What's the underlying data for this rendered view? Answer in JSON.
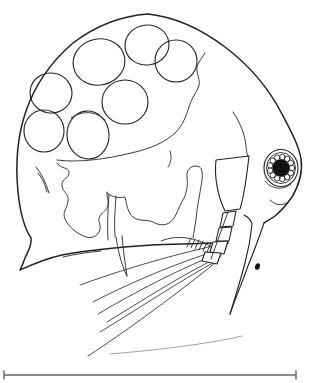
{
  "figure": {
    "background_color": "#ffffff",
    "ink_color": "#222222",
    "egg_count": 7,
    "eggs": [
      {
        "cx": 99,
        "cy": 62,
        "rx": 26,
        "ry": 23,
        "rot": -12
      },
      {
        "cx": 147,
        "cy": 45,
        "rx": 22,
        "ry": 20,
        "rot": -8
      },
      {
        "cx": 176,
        "cy": 61,
        "rx": 21,
        "ry": 21,
        "rot": 0
      },
      {
        "cx": 51,
        "cy": 93,
        "rx": 21,
        "ry": 20,
        "rot": 10
      },
      {
        "cx": 125,
        "cy": 102,
        "rx": 23,
        "ry": 22,
        "rot": 0
      },
      {
        "cx": 44,
        "cy": 131,
        "rx": 20,
        "ry": 21,
        "rot": 0
      },
      {
        "cx": 88,
        "cy": 135,
        "rx": 21,
        "ry": 24,
        "rot": -5
      }
    ],
    "eye": {
      "center": [
        281,
        168
      ],
      "pupil_radius": 8.5,
      "pupil_color": "#111111",
      "ommatidia_count": 13,
      "ommatidia_radius": 2.8,
      "ommatidia_ring_radius": 11,
      "inner_ring": {
        "rx": 14.5,
        "ry": 15.5
      },
      "outer_ring": {
        "rx": 17,
        "ry": 18.5
      }
    },
    "swimming_setae": [
      {
        "d": "M 229 243 C 195 249 135 265 80 285"
      },
      {
        "d": "M 226 248 C 190 258 135 280 93 302"
      },
      {
        "d": "M 223 252 C 185 266 135 292 98 314"
      },
      {
        "d": "M 221 256 C 183 274 140 302 107 322"
      },
      {
        "d": "M 218 260 C 180 281 133 312 100 332"
      },
      {
        "d": "M 215 263 C 182 290 128 330 88 356"
      }
    ],
    "faint_seta": {
      "d": "M 242 336 C 208 344 158 350 110 354"
    },
    "antenna_segments": [
      {
        "points": "223,213 236,211 233,226 220,227"
      },
      {
        "points": "219,228 232,227 229,241 216,241"
      },
      {
        "points": "213,242 228,241 224,254 210,252"
      },
      {
        "points": "205,252 221,253 217,264 202,261"
      }
    ],
    "comb_ticks": [
      [
        187,
        247,
        191,
        238
      ],
      [
        191,
        248,
        195,
        239
      ],
      [
        195,
        249,
        199,
        240
      ],
      [
        199,
        250,
        203,
        241
      ],
      [
        203,
        251,
        207,
        242
      ],
      [
        207,
        252,
        211,
        243
      ]
    ],
    "scale_bar": {
      "x1": 4,
      "x2": 296,
      "y": 375,
      "tick_height": 9,
      "color": "#8c8c8c",
      "tick_color": "#6f6f6f",
      "label": ""
    }
  }
}
